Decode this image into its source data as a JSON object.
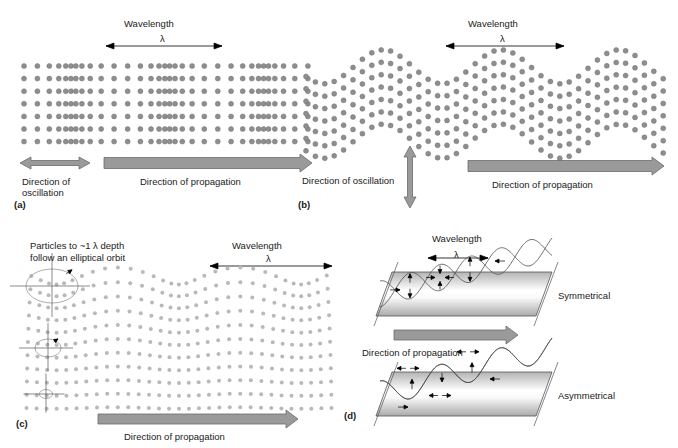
{
  "figure": {
    "background": "#ffffff",
    "particle_color": "#8e8e8e",
    "light_particle_color": "#b9b9b9",
    "arrow_fill": "#9a9a9a",
    "arrow_stroke": "#6b6b6b",
    "text_color": "#1a1a1a",
    "lambda_symbol": "λ"
  },
  "panels": [
    {
      "key": "a",
      "tag": "(a)",
      "wave_type": "longitudinal-compressional",
      "wavelength_title": "Wavelength",
      "lambda": "λ",
      "oscillation_label": "Direction of\noscillation",
      "propagation_label": "Direction of propagation",
      "oscillation_arrow": "double-horizontal",
      "propagation_arrow": "single-right"
    },
    {
      "key": "b",
      "tag": "(b)",
      "wave_type": "transverse-shear",
      "wavelength_title": "Wavelength",
      "lambda": "λ",
      "oscillation_label": "Direction of oscillation",
      "propagation_label": "Direction of propagation",
      "oscillation_arrow": "double-vertical",
      "propagation_arrow": "single-right"
    },
    {
      "key": "c",
      "tag": "(c)",
      "wave_type": "rayleigh-surface",
      "note_line1": "Particles to ~1 λ depth",
      "note_line2": "follow an elliptical orbit",
      "wavelength_title": "Wavelength",
      "lambda": "λ",
      "propagation_label": "Direction of propagation",
      "propagation_arrow": "single-right",
      "orbit_count": 3
    },
    {
      "key": "d",
      "tag": "(d)",
      "wave_type": "lamb-plate",
      "wavelength_title": "Wavelength",
      "lambda": "λ",
      "propagation_label": "Direction of propagation",
      "propagation_arrow": "single-right",
      "mode_labels": [
        "Symmetrical",
        "Asymmetrical"
      ]
    }
  ],
  "chart_data": {
    "type": "diagram",
    "panel_keys": [
      "a",
      "b",
      "c",
      "d"
    ],
    "panel_types": [
      "longitudinal (P) wave particle motion",
      "transverse (S) wave particle motion",
      "Rayleigh surface wave particle motion",
      "Lamb plate waves: symmetrical and asymmetrical modes"
    ]
  }
}
